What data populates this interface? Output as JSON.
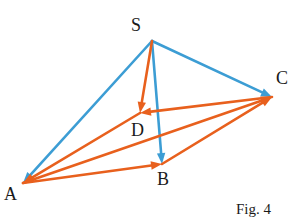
{
  "figure": {
    "caption": "Fig. 4",
    "caption_pos": {
      "x": 236,
      "y": 202
    },
    "background_color": "#ffffff",
    "canvas": {
      "width": 304,
      "height": 223
    }
  },
  "colors": {
    "blue": "#3c9dd4",
    "orange": "#e8601d",
    "label_text": "#1a1a1a"
  },
  "style": {
    "stroke_width": 2.6,
    "arrow_length": 11,
    "arrow_half_width": 4.2
  },
  "vertices": [
    {
      "id": "S",
      "label": "S",
      "x": 152,
      "y": 41,
      "label_x": 131,
      "label_y": 16
    },
    {
      "id": "A",
      "label": "A",
      "x": 23,
      "y": 183,
      "label_x": 4,
      "label_y": 185
    },
    {
      "id": "B",
      "label": "B",
      "x": 162,
      "y": 164,
      "label_x": 157,
      "label_y": 170
    },
    {
      "id": "C",
      "label": "C",
      "x": 272,
      "y": 97,
      "label_x": 276,
      "label_y": 69
    },
    {
      "id": "D",
      "label": "D",
      "x": 140,
      "y": 113,
      "label_x": 131,
      "label_y": 121
    }
  ],
  "edges": [
    {
      "id": "S-A",
      "from": "S",
      "to": "A",
      "color_key": "blue",
      "arrow_at_end": true,
      "label": "vector S to A"
    },
    {
      "id": "S-C",
      "from": "S",
      "to": "C",
      "color_key": "blue",
      "arrow_at_end": true,
      "label": "vector S to C"
    },
    {
      "id": "S-B",
      "from": "S",
      "to": "B",
      "color_key": "blue",
      "arrow_at_end": true,
      "label": "vector S to B"
    },
    {
      "id": "S-D",
      "from": "S",
      "to": "D",
      "color_key": "orange",
      "arrow_at_end": true,
      "label": "vector S to D"
    },
    {
      "id": "D-A",
      "from": "D",
      "to": "A",
      "color_key": "orange",
      "arrow_at_end": true,
      "label": "vector D to A"
    },
    {
      "id": "A-B",
      "from": "A",
      "to": "B",
      "color_key": "orange",
      "arrow_at_end": true,
      "label": "vector A to B"
    },
    {
      "id": "B-C",
      "from": "B",
      "to": "C",
      "color_key": "orange",
      "arrow_at_end": true,
      "label": "vector B to C"
    },
    {
      "id": "A-C",
      "from": "A",
      "to": "C",
      "color_key": "orange",
      "arrow_at_end": true,
      "label": "vector A to C through D"
    },
    {
      "id": "C-D",
      "from": "C",
      "to": "D",
      "color_key": "orange",
      "arrow_at_end": true,
      "label": "vector C to D"
    }
  ]
}
